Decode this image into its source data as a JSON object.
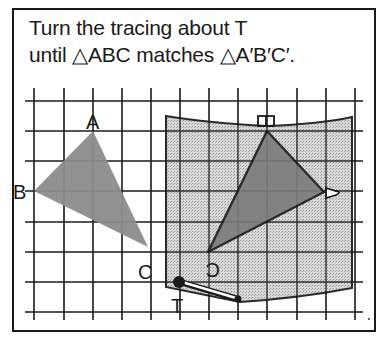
{
  "instruction": {
    "line1": "Turn the tracing about T",
    "line2": "until △ABC matches △A′B′C′."
  },
  "grid": {
    "x_lines": [
      34,
      64,
      93,
      122,
      151,
      180,
      209,
      238,
      267,
      297,
      326,
      355
    ],
    "y_lines": [
      101,
      131,
      161,
      191,
      222,
      252,
      282,
      312
    ],
    "spacing_px": 30,
    "line_color": "#1a1a1a"
  },
  "triangle_abc": {
    "labels": {
      "A": "A",
      "B": "B",
      "C": "C"
    },
    "vertices": {
      "A": [
        93,
        131
      ],
      "B": [
        34,
        191
      ],
      "C": [
        148,
        247
      ]
    },
    "fill": "#8c8c8c"
  },
  "tracing": {
    "fill": "#c9c9c9",
    "triangle_fill": "#7d7d7d",
    "image_vertices": {
      "A_prime": [
        267,
        131
      ],
      "B_prime": [
        324,
        192
      ],
      "C_prime": [
        208,
        252
      ]
    },
    "pivot_label": "T",
    "pivot": [
      179,
      282
    ]
  },
  "colors": {
    "ink": "#1a1a1a",
    "background": "#ffffff"
  }
}
